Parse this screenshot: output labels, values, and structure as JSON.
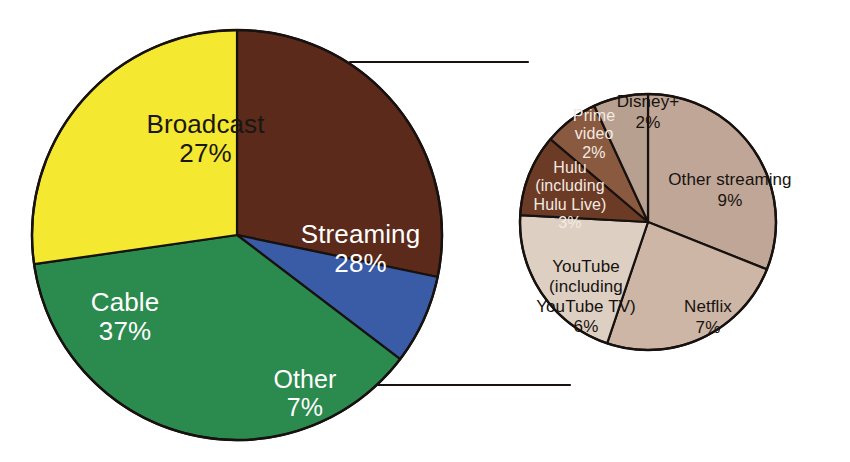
{
  "chart_data": {
    "type": "pie",
    "title": "",
    "subtitle": "",
    "xlabel": "",
    "ylabel": "",
    "legend_position": "none",
    "grid": false,
    "charts": [
      {
        "name": "main-pie",
        "note": "Share of TV viewing by platform type",
        "start_angle_deg": 0,
        "direction": "clockwise",
        "slices": [
          {
            "label": "Streaming",
            "value": 28,
            "value_label": "28%",
            "color": "#5b2a1a",
            "text_color": "#ffffff"
          },
          {
            "label": "Other",
            "value": 7,
            "value_label": "7%",
            "color": "#3a5ba5",
            "text_color": "#ffffff"
          },
          {
            "label": "Cable",
            "value": 37,
            "value_label": "37%",
            "color": "#2b8a4e",
            "text_color": "#ffffff"
          },
          {
            "label": "Broadcast",
            "value": 27,
            "value_label": "27%",
            "color": "#f5e831",
            "text_color": "#1a1713"
          }
        ]
      },
      {
        "name": "streaming-breakdown-pie",
        "note": "Breakdown of the Streaming slice",
        "start_angle_deg": 0,
        "direction": "clockwise",
        "slices": [
          {
            "label": "Other streaming",
            "value": 9,
            "value_label": "9%",
            "color": "#bfa696",
            "text_color": "#17120f"
          },
          {
            "label": "Netflix",
            "value": 7,
            "value_label": "7%",
            "color": "#cdb6a6",
            "text_color": "#17120f"
          },
          {
            "label": "YouTube (including YouTube TV)",
            "value": 6,
            "value_label": "6%",
            "color": "#ddd0c3",
            "text_color": "#17120f"
          },
          {
            "label": "Hulu (including Hulu Live)",
            "value": 3,
            "value_label": "3%",
            "color": "#6b3b26",
            "text_color": "#f3eae2"
          },
          {
            "label": "Prime video",
            "value": 2,
            "value_label": "2%",
            "color": "#8a5a40",
            "text_color": "#f3eae2"
          },
          {
            "label": "Disney+",
            "value": 2,
            "value_label": "2%",
            "color": "#b8a090",
            "text_color": "#17120f"
          }
        ]
      }
    ]
  },
  "labels": {
    "broadcast": {
      "name": "Broadcast",
      "pct": "27%"
    },
    "streaming": {
      "name": "Streaming",
      "pct": "28%"
    },
    "cable": {
      "name": "Cable",
      "pct": "37%"
    },
    "other": {
      "name": "Other",
      "pct": "7%"
    },
    "other_streaming": {
      "name": "Other streaming",
      "pct": "9%"
    },
    "netflix": {
      "name": "Netflix",
      "pct": "7%"
    },
    "youtube": {
      "name": "YouTube\n(including\nYouTube TV)",
      "pct": "6%"
    },
    "hulu": {
      "name": "Hulu\n(including\nHulu Live)",
      "pct": "3%"
    },
    "prime_video": {
      "name": "Prime\nvideo",
      "pct": "2%"
    },
    "disney_plus": {
      "name": "Disney+",
      "pct": "2%"
    }
  },
  "colors": {
    "background": "#ffffff",
    "outline": "#17120f",
    "broadcast": "#f5e831",
    "streaming": "#5b2a1a",
    "cable": "#2b8a4e",
    "other": "#3a5ba5",
    "other_streaming": "#bfa696",
    "netflix": "#cdb6a6",
    "youtube": "#ddd0c3",
    "hulu": "#6b3b26",
    "prime_video": "#8a5a40",
    "disney_plus": "#b8a090"
  }
}
